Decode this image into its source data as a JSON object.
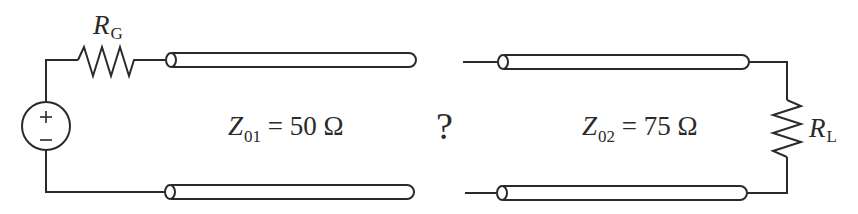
{
  "diagram": {
    "type": "transmission-line-circuit",
    "source": {
      "name": "voltage-source",
      "plus": "+",
      "minus": "−"
    },
    "generator_resistor": {
      "symbol": "R",
      "subscript": "G"
    },
    "load_resistor": {
      "symbol": "R",
      "subscript": "L"
    },
    "line1": {
      "symbol": "Z",
      "subscript": "01",
      "equals": " = ",
      "value": "50 Ω"
    },
    "line2": {
      "symbol": "Z",
      "subscript": "02",
      "equals": " = ",
      "value": "75 Ω"
    },
    "unknown": "?",
    "colors": {
      "stroke": "#2a2a2a",
      "background": "#ffffff"
    }
  }
}
